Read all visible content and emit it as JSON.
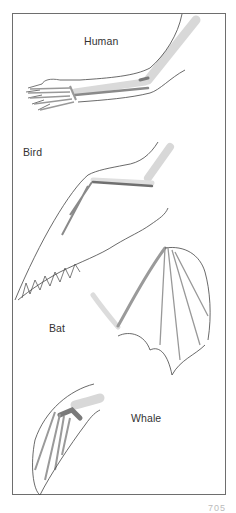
{
  "figure": {
    "panels": [
      {
        "id": "human",
        "label": "Human"
      },
      {
        "id": "bird",
        "label": "Bird"
      },
      {
        "id": "bat",
        "label": "Bat"
      },
      {
        "id": "whale",
        "label": "Whale"
      }
    ],
    "page_number_fragment": "705"
  },
  "colors": {
    "frame": "#6e6e6e",
    "outline": "#444444",
    "humerus_light": "#d6d6d6",
    "radius_ulna_dark": "#7a7a7a",
    "background": "#ffffff"
  }
}
